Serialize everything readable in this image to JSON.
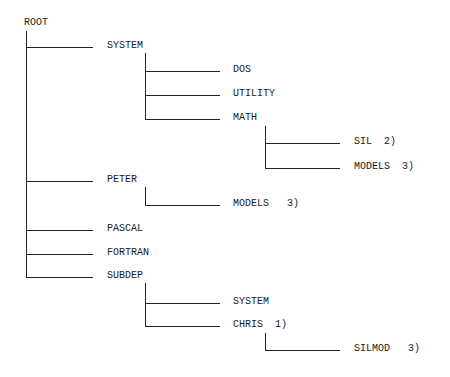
{
  "diagram": {
    "type": "directory-tree",
    "root": "ROOT",
    "nodes": {
      "root": "ROOT",
      "system": "SYSTEM",
      "dos": "DOS",
      "utility": "UTILITY",
      "math": "MATH",
      "sil": "SIL  2)",
      "math_models": "MODELS  3)",
      "peter": "PETER",
      "peter_models": "MODELS   3)",
      "pascal": "PASCAL",
      "fortran": "FORTRAN",
      "subdep": "SUBDEP",
      "subdep_system": "SYSTEM",
      "chris": "CHRIS  1)",
      "silmod": "SILMOD   3)"
    },
    "tree": {
      "label": "ROOT",
      "children": [
        {
          "label": "SYSTEM",
          "children": [
            {
              "label": "DOS"
            },
            {
              "label": "UTILITY"
            },
            {
              "label": "MATH",
              "children": [
                {
                  "label": "SIL",
                  "note": "2)"
                },
                {
                  "label": "MODELS",
                  "note": "3)"
                }
              ]
            }
          ]
        },
        {
          "label": "PETER",
          "children": [
            {
              "label": "MODELS",
              "note": "3)"
            }
          ]
        },
        {
          "label": "PASCAL"
        },
        {
          "label": "FORTRAN"
        },
        {
          "label": "SUBDEP",
          "children": [
            {
              "label": "SYSTEM"
            },
            {
              "label": "CHRIS",
              "note": "1)",
              "children": [
                {
                  "label": "SILMOD",
                  "note": "3)"
                }
              ]
            }
          ]
        }
      ]
    }
  }
}
